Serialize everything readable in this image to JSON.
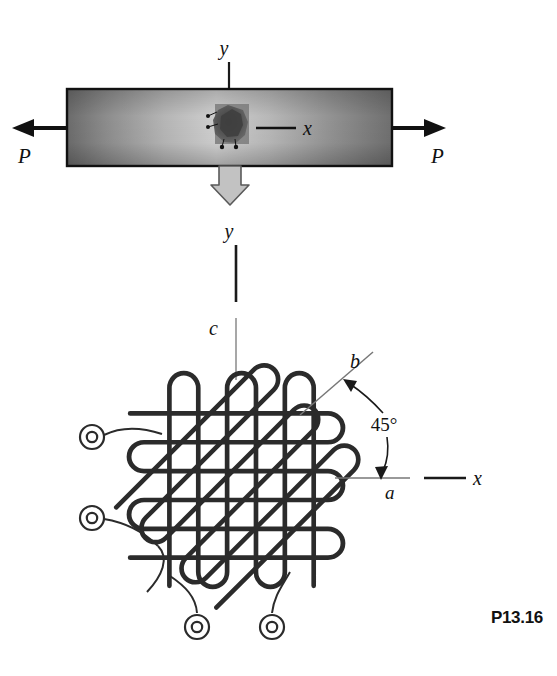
{
  "figure": {
    "number": "P13.16",
    "domain": "mechanics-of-materials-problem-figure",
    "background_color": "#ffffff",
    "ink_color": "#1a1a1a"
  },
  "top_view": {
    "description": "Flat bar in axial tension with a strain rosette bonded at mid-length",
    "bar": {
      "x": 67,
      "y": 89,
      "width": 325,
      "height": 77,
      "border_color": "#111111",
      "fill_gradient": {
        "type": "linear-horizontal",
        "stops": [
          "#6e6e6e",
          "#9a9a9a",
          "#c9c9c9",
          "#a8a8a8",
          "#7a7a7a"
        ]
      }
    },
    "load_left": {
      "label": "P",
      "label_x": 18,
      "label_y": 158,
      "arrow_direction": "left"
    },
    "load_right": {
      "label": "P",
      "label_x": 436,
      "label_y": 158,
      "arrow_direction": "right"
    },
    "y_axis": {
      "label": "y",
      "label_x": 224,
      "label_y": 48,
      "orientation": "vertical-down"
    },
    "x_axis": {
      "label": "x",
      "label_x": 303,
      "label_y": 134,
      "orientation": "horizontal-right"
    },
    "gauge_blob": {
      "center_x": 233,
      "center_y": 127,
      "fill": "#4a4a4a"
    },
    "callout_arrow": {
      "direction": "down",
      "fill": "#c0c0c0",
      "stroke": "#555555"
    }
  },
  "connector": {
    "y_label": "y",
    "y_label_x": 229,
    "y_label_y": 231,
    "c_label": "c",
    "c_label_x": 213,
    "c_label_y": 330,
    "thick_line": {
      "x": 236,
      "y1": 240,
      "y2": 300
    },
    "thin_line": {
      "x": 236,
      "y1": 315,
      "y2": 378
    }
  },
  "rosette": {
    "description": "45-degree three-element strain rosette (rectangular rosette) with grids a, b, c",
    "center_x": 236,
    "center_y": 480,
    "grids": [
      {
        "name": "a",
        "direction": "horizontal",
        "angle_deg": 0,
        "label": "a"
      },
      {
        "name": "b",
        "direction": "diagonal",
        "angle_deg": 45,
        "label": "b"
      },
      {
        "name": "c",
        "direction": "vertical",
        "angle_deg": 90,
        "label": "c"
      }
    ],
    "angle_annotation": {
      "text": "45°",
      "x": 384,
      "y": 427
    },
    "labels": {
      "b": {
        "text": "b",
        "x": 355,
        "y": 362
      },
      "a": {
        "text": "a",
        "x": 389,
        "y": 497
      },
      "x": {
        "text": "x",
        "x": 476,
        "y": 479
      }
    },
    "axis_a_line": {
      "x1": 335,
      "x2": 410,
      "y": 478,
      "color": "#777777"
    },
    "axis_x_line": {
      "x1": 424,
      "x2": 466,
      "y": 478,
      "color": "#1a1a1a"
    },
    "axis_b_line": {
      "x1": 300,
      "y1": 415,
      "x2": 373,
      "y2": 352,
      "color": "#777777"
    },
    "terminals": [
      {
        "id": "terminal-a-left",
        "cx": 92,
        "cy": 437
      },
      {
        "id": "terminal-b-left",
        "cx": 92,
        "cy": 518
      },
      {
        "id": "terminal-c-bottom-left",
        "cx": 197,
        "cy": 627
      },
      {
        "id": "terminal-c-bottom-right",
        "cx": 272,
        "cy": 627
      }
    ]
  }
}
